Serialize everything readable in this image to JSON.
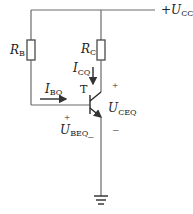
{
  "diagram": {
    "supply": {
      "sign": "+",
      "main": "U",
      "sub": "CC"
    },
    "resistor_base": {
      "main": "R",
      "sub": "B"
    },
    "resistor_collector": {
      "main": "R",
      "sub": "C"
    },
    "transistor": {
      "label": "T"
    },
    "base_current": {
      "main": "I",
      "sub": "BQ"
    },
    "collector_current": {
      "main": "I",
      "sub": "CQ"
    },
    "vce": {
      "main": "U",
      "sub": "CEQ",
      "plus": "+",
      "minus": "–"
    },
    "vbe": {
      "main": "U",
      "sub": "BEQ",
      "plus": "+",
      "minus": "_"
    },
    "ground": {
      "icon": "ground-icon"
    }
  }
}
